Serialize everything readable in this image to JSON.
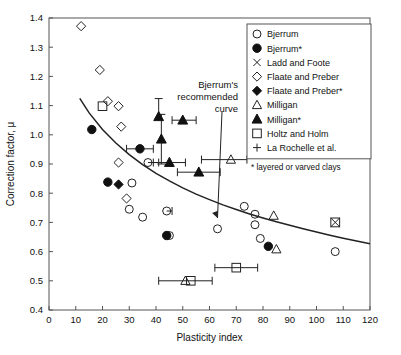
{
  "chart_data": {
    "type": "scatter",
    "title": "",
    "xlabel": "Plasticity index",
    "ylabel": "Correction factor, μ",
    "xlim": [
      0,
      120
    ],
    "ylim": [
      0.4,
      1.4
    ],
    "xticks": [
      0,
      10,
      20,
      30,
      40,
      50,
      60,
      70,
      80,
      90,
      100,
      110,
      120
    ],
    "yticks": [
      0.4,
      0.5,
      0.6,
      0.7,
      0.8,
      0.9,
      1.0,
      1.1,
      1.2,
      1.3,
      1.4
    ],
    "grid": false,
    "legend_position": "top-right",
    "legend": [
      {
        "marker": "open-circle",
        "label": "Bjerrum"
      },
      {
        "marker": "filled-circle",
        "label": "Bjerrum*"
      },
      {
        "marker": "x-cross",
        "label": "Ladd and Foote"
      },
      {
        "marker": "open-diamond",
        "label": "Flaate and Preber"
      },
      {
        "marker": "filled-diamond",
        "label": "Flaate and Preber*"
      },
      {
        "marker": "open-triangle",
        "label": "Milligan"
      },
      {
        "marker": "filled-triangle",
        "label": "Milligan*"
      },
      {
        "marker": "open-square",
        "label": "Holtz and Holm"
      },
      {
        "marker": "plus",
        "label": "La Rochelle et al."
      }
    ],
    "footnote": "* layered or varved clays",
    "annotations": [
      {
        "text_lines": [
          "Bjerrum's",
          "recommended",
          "curve"
        ],
        "target_x": 63,
        "target_y": 0.715
      }
    ],
    "curve": {
      "name": "Bjerrum's recommended curve",
      "points": [
        [
          11.5,
          1.125
        ],
        [
          15,
          1.075
        ],
        [
          20,
          1.018
        ],
        [
          25,
          0.972
        ],
        [
          30,
          0.932
        ],
        [
          35,
          0.898
        ],
        [
          40,
          0.868
        ],
        [
          45,
          0.842
        ],
        [
          50,
          0.818
        ],
        [
          55,
          0.797
        ],
        [
          60,
          0.778
        ],
        [
          65,
          0.76
        ],
        [
          70,
          0.744
        ],
        [
          75,
          0.729
        ],
        [
          80,
          0.715
        ],
        [
          85,
          0.702
        ],
        [
          90,
          0.69
        ],
        [
          95,
          0.678
        ],
        [
          100,
          0.667
        ],
        [
          105,
          0.656
        ],
        [
          110,
          0.646
        ],
        [
          115,
          0.636
        ],
        [
          120,
          0.627
        ]
      ]
    },
    "series": [
      {
        "name": "Bjerrum",
        "marker": "open-circle",
        "points": [
          [
            37,
            0.905
          ],
          [
            31,
            0.835
          ],
          [
            30,
            0.745
          ],
          [
            35,
            0.718
          ],
          [
            44,
            0.739
          ],
          [
            45,
            0.655
          ],
          [
            63,
            0.678
          ],
          [
            73,
            0.755
          ],
          [
            77,
            0.728
          ],
          [
            77,
            0.692
          ],
          [
            79,
            0.645
          ],
          [
            107,
            0.6
          ]
        ]
      },
      {
        "name": "Bjerrum*",
        "marker": "filled-circle",
        "points": [
          [
            16,
            1.018
          ],
          [
            22,
            0.838
          ],
          [
            34,
            0.952
          ],
          [
            44,
            0.655
          ],
          [
            82,
            0.618
          ]
        ]
      },
      {
        "name": "Ladd and Foote",
        "marker": "x-cross",
        "points": [
          [
            107,
            0.7
          ]
        ]
      },
      {
        "name": "Flaate and Preber",
        "marker": "open-diamond",
        "points": [
          [
            12,
            1.372
          ],
          [
            19,
            1.222
          ],
          [
            22,
            1.115
          ],
          [
            26,
            1.098
          ],
          [
            27,
            1.028
          ],
          [
            26,
            0.905
          ],
          [
            29,
            0.782
          ]
        ]
      },
      {
        "name": "Flaate and Preber*",
        "marker": "filled-diamond",
        "points": [
          [
            26,
            0.83
          ]
        ]
      },
      {
        "name": "Milligan",
        "marker": "open-triangle",
        "points": [
          [
            68,
            0.915
          ],
          [
            84,
            0.723
          ],
          [
            85,
            0.608
          ],
          [
            51,
            0.5
          ]
        ]
      },
      {
        "name": "Milligan*",
        "marker": "filled-triangle",
        "points": [
          [
            41,
            1.062
          ],
          [
            42,
            0.985
          ],
          [
            50,
            1.05
          ],
          [
            45,
            0.905
          ],
          [
            56,
            0.872
          ]
        ]
      },
      {
        "name": "Holtz and Holm",
        "marker": "open-square",
        "points": [
          [
            20,
            1.098
          ],
          [
            53,
            0.5
          ],
          [
            70,
            0.545
          ]
        ]
      },
      {
        "name": "La Rochelle et al.",
        "marker": "plus-with-errorbar",
        "points": [
          {
            "x": 41,
            "y": 1.062,
            "xerr_low": 0,
            "xerr_high": 0,
            "yerr_low": 0,
            "yerr_high": 0.062
          },
          {
            "x": 42,
            "y": 0.985,
            "xerr_low": 0,
            "xerr_high": 0,
            "yerr_low": 0.085,
            "yerr_high": 0.085
          },
          {
            "x": 50,
            "y": 1.05,
            "xerr_low": 4,
            "xerr_high": 5,
            "yerr_low": 0,
            "yerr_high": 0
          },
          {
            "x": 45,
            "y": 0.905,
            "xerr_low": 6,
            "xerr_high": 6,
            "yerr_low": 0,
            "yerr_high": 0
          },
          {
            "x": 56,
            "y": 0.872,
            "xerr_low": 8,
            "xerr_high": 8,
            "yerr_low": 0,
            "yerr_high": 0
          },
          {
            "x": 34,
            "y": 0.952,
            "xerr_low": 5,
            "xerr_high": 5,
            "yerr_low": 0,
            "yerr_high": 0
          },
          {
            "x": 37,
            "y": 0.905,
            "xerr_low": 0,
            "xerr_high": 4,
            "yerr_low": 0,
            "yerr_high": 0
          },
          {
            "x": 68,
            "y": 0.915,
            "xerr_low": 11,
            "xerr_high": 6,
            "yerr_low": 0,
            "yerr_high": 0
          },
          {
            "x": 44,
            "y": 0.739,
            "xerr_low": 0,
            "xerr_high": 2,
            "yerr_low": 0,
            "yerr_high": 0
          },
          {
            "x": 51,
            "y": 0.5,
            "xerr_low": 10,
            "xerr_high": 10,
            "yerr_low": 0,
            "yerr_high": 0
          },
          {
            "x": 70,
            "y": 0.545,
            "xerr_low": 8,
            "xerr_high": 8,
            "yerr_low": 0,
            "yerr_high": 0
          }
        ]
      }
    ]
  }
}
